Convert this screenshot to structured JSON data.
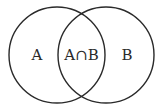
{
  "diagram": {
    "type": "venn",
    "sets": [
      {
        "id": "A",
        "label": "A",
        "cx": 57,
        "cy": 55,
        "r": 48
      },
      {
        "id": "B",
        "label": "B",
        "cx": 106,
        "cy": 55,
        "r": 48
      }
    ],
    "intersection": {
      "label": "A∩B"
    },
    "colors": {
      "stroke": "#2a2a2a",
      "background": "#ffffff"
    }
  }
}
